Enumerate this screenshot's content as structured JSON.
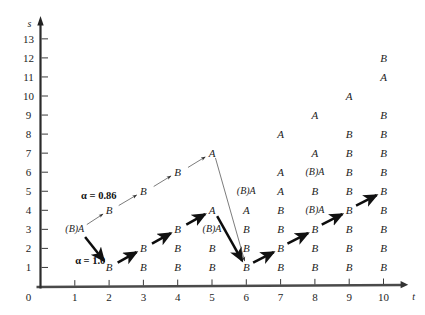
{
  "figure": {
    "title": "",
    "x_axis_label": "t",
    "y_axis_label": "s",
    "origin_label": "0"
  },
  "chart_data": {
    "type": "scatter",
    "title": "",
    "xlabel": "t",
    "ylabel": "s",
    "xlim": [
      0,
      10.6
    ],
    "ylim": [
      0,
      14.2
    ],
    "grid": false,
    "legend": null,
    "x_ticks": [
      "1",
      "2",
      "3",
      "4",
      "5",
      "6",
      "7",
      "8",
      "9",
      "10"
    ],
    "x_tick_values": [
      1,
      2,
      3,
      4,
      5,
      6,
      7,
      8,
      9,
      10
    ],
    "y_ticks": [
      "1",
      "2",
      "3",
      "4",
      "5",
      "6",
      "7",
      "8",
      "9",
      "10",
      "11",
      "12",
      "13"
    ],
    "y_tick_values": [
      1,
      2,
      3,
      4,
      5,
      6,
      7,
      8,
      9,
      10,
      11,
      12,
      13
    ],
    "point_labels": [
      {
        "t": 1,
        "s": 3,
        "text": "(B)A"
      },
      {
        "t": 2,
        "s": 4,
        "text": "B"
      },
      {
        "t": 3,
        "s": 5,
        "text": "B"
      },
      {
        "t": 4,
        "s": 6,
        "text": "B"
      },
      {
        "t": 5,
        "s": 7,
        "text": "A"
      },
      {
        "t": 2,
        "s": 1,
        "text": "B"
      },
      {
        "t": 3,
        "s": 2,
        "text": "B"
      },
      {
        "t": 4,
        "s": 3,
        "text": "B"
      },
      {
        "t": 5,
        "s": 4,
        "text": "A"
      },
      {
        "t": 3,
        "s": 1,
        "text": "B"
      },
      {
        "t": 4,
        "s": 2,
        "text": "B"
      },
      {
        "t": 5,
        "s": 3,
        "text": "(B)A"
      },
      {
        "t": 4,
        "s": 1,
        "text": "B"
      },
      {
        "t": 5,
        "s": 2,
        "text": "B"
      },
      {
        "t": 5,
        "s": 1,
        "text": "B"
      },
      {
        "t": 6,
        "s": 5,
        "text": "(B)A"
      },
      {
        "t": 6,
        "s": 4,
        "text": "A"
      },
      {
        "t": 6,
        "s": 3,
        "text": "B"
      },
      {
        "t": 6,
        "s": 2,
        "text": "B"
      },
      {
        "t": 6,
        "s": 1,
        "text": "B"
      },
      {
        "t": 7,
        "s": 8,
        "text": "A"
      },
      {
        "t": 7,
        "s": 6,
        "text": "A"
      },
      {
        "t": 7,
        "s": 5,
        "text": "A"
      },
      {
        "t": 7,
        "s": 4,
        "text": "B"
      },
      {
        "t": 7,
        "s": 3,
        "text": "B"
      },
      {
        "t": 7,
        "s": 2,
        "text": "B"
      },
      {
        "t": 7,
        "s": 1,
        "text": "B"
      },
      {
        "t": 8,
        "s": 9,
        "text": "A"
      },
      {
        "t": 8,
        "s": 7,
        "text": "A"
      },
      {
        "t": 8,
        "s": 6,
        "text": "(B)A"
      },
      {
        "t": 8,
        "s": 5,
        "text": "B"
      },
      {
        "t": 8,
        "s": 4,
        "text": "(B)A"
      },
      {
        "t": 8,
        "s": 3,
        "text": "B"
      },
      {
        "t": 8,
        "s": 2,
        "text": "B"
      },
      {
        "t": 8,
        "s": 1,
        "text": "B"
      },
      {
        "t": 9,
        "s": 10,
        "text": "A"
      },
      {
        "t": 9,
        "s": 8,
        "text": "B"
      },
      {
        "t": 9,
        "s": 7,
        "text": "B"
      },
      {
        "t": 9,
        "s": 6,
        "text": "B"
      },
      {
        "t": 9,
        "s": 5,
        "text": "B"
      },
      {
        "t": 9,
        "s": 4,
        "text": "B"
      },
      {
        "t": 9,
        "s": 3,
        "text": "B"
      },
      {
        "t": 9,
        "s": 2,
        "text": "B"
      },
      {
        "t": 9,
        "s": 1,
        "text": "B"
      },
      {
        "t": 10,
        "s": 11,
        "text": "A"
      },
      {
        "t": 10,
        "s": 12,
        "text": "B"
      },
      {
        "t": 10,
        "s": 9,
        "text": "B"
      },
      {
        "t": 10,
        "s": 8,
        "text": "B"
      },
      {
        "t": 10,
        "s": 7,
        "text": "B"
      },
      {
        "t": 10,
        "s": 6,
        "text": "B"
      },
      {
        "t": 10,
        "s": 5,
        "text": "B"
      },
      {
        "t": 10,
        "s": 4,
        "text": "B"
      },
      {
        "t": 10,
        "s": 3,
        "text": "B"
      },
      {
        "t": 10,
        "s": 2,
        "text": "B"
      },
      {
        "t": 10,
        "s": 1,
        "text": "B"
      }
    ],
    "paths": [
      {
        "name": "alpha-086-path",
        "style": "thin",
        "annotation": "α = 0.86",
        "annotation_at": {
          "t": 1.7,
          "s": 4.8
        },
        "segments": [
          {
            "from": {
              "t": 1.35,
              "s": 3.25
            },
            "to": {
              "t": 1.82,
              "s": 3.8
            }
          },
          {
            "from": {
              "t": 2.28,
              "s": 4.25
            },
            "to": {
              "t": 2.8,
              "s": 4.8
            }
          },
          {
            "from": {
              "t": 3.3,
              "s": 5.25
            },
            "to": {
              "t": 3.8,
              "s": 5.8
            }
          },
          {
            "from": {
              "t": 4.3,
              "s": 6.25
            },
            "to": {
              "t": 4.8,
              "s": 6.8
            }
          }
        ]
      },
      {
        "name": "alpha-10-path",
        "style": "thick",
        "annotation": "α = 1.0",
        "annotation_at": {
          "t": 1.45,
          "s": 1.4
        },
        "segments": [
          {
            "from": {
              "t": 1.3,
              "s": 2.6
            },
            "to": {
              "t": 1.85,
              "s": 1.35
            }
          },
          {
            "from": {
              "t": 2.25,
              "s": 1.25
            },
            "to": {
              "t": 2.8,
              "s": 1.8
            }
          },
          {
            "from": {
              "t": 3.25,
              "s": 2.25
            },
            "to": {
              "t": 3.8,
              "s": 2.8
            }
          },
          {
            "from": {
              "t": 4.25,
              "s": 3.25
            },
            "to": {
              "t": 4.8,
              "s": 3.8
            }
          },
          {
            "from": {
              "t": 5.15,
              "s": 3.7
            },
            "to": {
              "t": 5.88,
              "s": 1.35
            }
          },
          {
            "from": {
              "t": 6.2,
              "s": 1.25
            },
            "to": {
              "t": 6.8,
              "s": 1.8
            }
          },
          {
            "from": {
              "t": 7.2,
              "s": 2.25
            },
            "to": {
              "t": 7.8,
              "s": 2.8
            }
          },
          {
            "from": {
              "t": 8.2,
              "s": 3.25
            },
            "to": {
              "t": 8.8,
              "s": 3.8
            }
          },
          {
            "from": {
              "t": 9.2,
              "s": 4.25
            },
            "to": {
              "t": 9.8,
              "s": 4.8
            }
          }
        ]
      },
      {
        "name": "thin-descent-path",
        "style": "thin",
        "annotation": "",
        "segments": [
          {
            "from": {
              "t": 5.1,
              "s": 6.75
            },
            "to": {
              "t": 5.95,
              "s": 1.35
            }
          }
        ]
      }
    ],
    "annotations": [
      {
        "text": "α = 0.86",
        "t": 1.7,
        "s": 4.8
      },
      {
        "text": "α = 1.0",
        "t": 1.45,
        "s": 1.4
      }
    ]
  }
}
